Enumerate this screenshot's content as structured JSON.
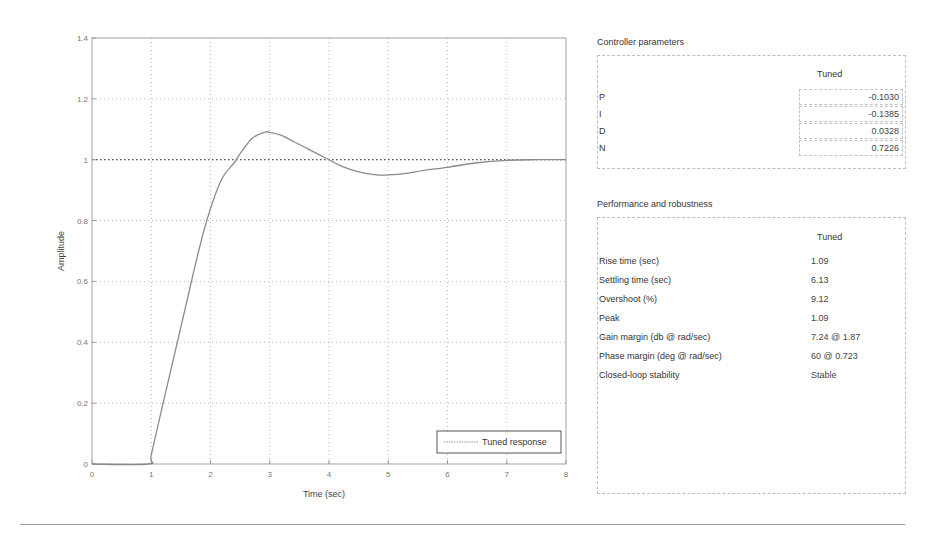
{
  "chart_data": {
    "type": "line",
    "title": "",
    "xlabel": "Time (sec)",
    "ylabel": "Amplitude",
    "xlim": [
      0,
      8
    ],
    "ylim": [
      0,
      1.4
    ],
    "x_ticks": [
      "0",
      "1",
      "2",
      "3",
      "4",
      "5",
      "6",
      "7",
      "8"
    ],
    "y_ticks": [
      "0",
      "0.2",
      "0.4",
      "0.6",
      "0.8",
      "1",
      "1.2",
      "1.4"
    ],
    "grid": true,
    "legend": {
      "entries": [
        "Tuned response"
      ],
      "position": "lower right"
    },
    "reference_line": {
      "y": 1.0,
      "style": "dotted"
    },
    "series": [
      {
        "name": "Tuned response",
        "x": [
          0,
          0.95,
          1.0,
          1.2,
          1.5,
          1.8,
          2.0,
          2.2,
          2.4,
          2.5,
          2.7,
          2.9,
          3.0,
          3.2,
          3.4,
          3.6,
          3.8,
          4.0,
          4.2,
          4.5,
          4.8,
          5.0,
          5.3,
          5.6,
          6.0,
          6.5,
          7.0,
          7.5,
          8.0
        ],
        "values": [
          0,
          0,
          0.03,
          0.2,
          0.45,
          0.7,
          0.84,
          0.94,
          0.99,
          1.02,
          1.07,
          1.09,
          1.09,
          1.08,
          1.06,
          1.04,
          1.02,
          1.0,
          0.98,
          0.96,
          0.95,
          0.95,
          0.955,
          0.965,
          0.975,
          0.99,
          0.998,
          1.0,
          1.0
        ]
      }
    ]
  },
  "controller_parameters": {
    "title": "Controller parameters",
    "column_header": "Tuned",
    "rows": [
      {
        "name": "P",
        "value": "-0.1030"
      },
      {
        "name": "I",
        "value": "-0.1385"
      },
      {
        "name": "D",
        "value": "0.0328"
      },
      {
        "name": "N",
        "value": "0.7226"
      }
    ]
  },
  "performance": {
    "title": "Performance and robustness",
    "column_header": "Tuned",
    "rows": [
      {
        "name": "Rise time (sec)",
        "value": "1.09"
      },
      {
        "name": "Settling time (sec)",
        "value": "6.13"
      },
      {
        "name": "Overshoot (%)",
        "value": "9.12"
      },
      {
        "name": "Peak",
        "value": "1.09"
      },
      {
        "name": "Gain margin (db @ rad/sec)",
        "value": "7.24 @ 1.87"
      },
      {
        "name": "Phase margin (deg @ rad/sec)",
        "value": "60 @ 0.723"
      },
      {
        "name": "Closed-loop stability",
        "value": "Stable"
      }
    ]
  },
  "colors": {
    "curve": "#8a8a8a",
    "grid": "#bbbbbb",
    "axes": "#999999",
    "text": "#333333"
  }
}
